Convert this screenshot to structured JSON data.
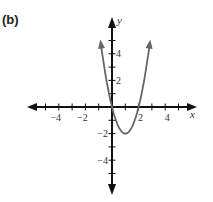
{
  "panel": {
    "label": "(b)"
  },
  "chart_data": {
    "type": "line",
    "title": "",
    "function": "y = 2x^2 - 4x",
    "xlabel": "x",
    "ylabel": "y",
    "xlim": [
      -6,
      6
    ],
    "ylim": [
      -6,
      6
    ],
    "grid": false,
    "x_ticks": [
      -4,
      -2,
      2,
      4
    ],
    "y_ticks": [
      4,
      2,
      -2,
      -4
    ],
    "x_tick_labels": [
      "−4",
      "−2",
      "2",
      "4"
    ],
    "y_tick_labels": [
      "4",
      "2",
      "−2",
      "−4"
    ],
    "series": [
      {
        "name": "parabola",
        "color": "#666666",
        "x": [
          -0.85,
          -0.5,
          0,
          0.5,
          1,
          1.5,
          2,
          2.5,
          2.85
        ],
        "y": [
          4.85,
          2.5,
          0,
          -1.5,
          -2,
          -1.5,
          0,
          2.5,
          4.85
        ]
      }
    ],
    "key_points": {
      "vertex": [
        1,
        -2
      ],
      "x_intercepts": [
        0,
        2
      ],
      "y_intercept": 0
    }
  },
  "colors": {
    "axis": "#111111",
    "curve": "#666666"
  }
}
